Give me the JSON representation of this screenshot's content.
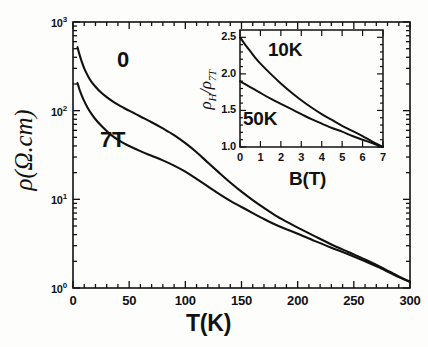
{
  "figure": {
    "background_color": "#fdfdfc",
    "ink_color": "#111111"
  },
  "chart_data": [
    {
      "id": "main",
      "type": "line",
      "title": "",
      "xlabel": "T(K)",
      "ylabel": "ρ(Ω.cm)",
      "xlim": [
        0,
        300
      ],
      "ylim": [
        1,
        1000
      ],
      "yscale": "log",
      "xscale": "linear",
      "grid": false,
      "legend_position": "inline-annotations",
      "xticks": [
        0,
        50,
        100,
        150,
        200,
        250,
        300
      ],
      "xticklabels": [
        "0",
        "50",
        "100",
        "150",
        "200",
        "250",
        "300"
      ],
      "yticks": [
        1,
        10,
        100,
        1000
      ],
      "yticklabels": [
        "10⁰",
        "10¹",
        "10²",
        "10³"
      ],
      "series": [
        {
          "name": "0",
          "label": "0",
          "description": "zero magnetic field resistivity",
          "x": [
            4,
            6,
            8,
            10,
            13,
            16,
            20,
            25,
            30,
            35,
            40,
            45,
            50,
            60,
            70,
            80,
            90,
            100,
            110,
            120,
            130,
            140,
            150,
            160,
            170,
            180,
            190,
            200,
            215,
            230,
            245,
            260,
            275,
            290,
            300
          ],
          "y": [
            520,
            420,
            350,
            300,
            250,
            215,
            186,
            160,
            142,
            128,
            117,
            108,
            100,
            86,
            74,
            63,
            53,
            43,
            34,
            26,
            20,
            15.5,
            12.2,
            9.8,
            8.0,
            6.6,
            5.6,
            4.8,
            3.85,
            3.1,
            2.55,
            2.1,
            1.7,
            1.35,
            1.18
          ]
        },
        {
          "name": "7T",
          "label": "7T",
          "description": "resistivity in 7 Tesla applied field",
          "x": [
            4,
            6,
            8,
            10,
            13,
            16,
            20,
            25,
            30,
            35,
            40,
            45,
            50,
            60,
            70,
            80,
            90,
            100,
            110,
            120,
            130,
            140,
            150,
            160,
            170,
            180,
            190,
            200,
            215,
            230,
            245,
            260,
            275,
            290,
            300
          ],
          "y": [
            205,
            170,
            146,
            128,
            108,
            94,
            80,
            68,
            59,
            52,
            47,
            43,
            40,
            35,
            31,
            27.5,
            24,
            20.5,
            17,
            14,
            11.5,
            9.6,
            8.2,
            7.0,
            6.0,
            5.2,
            4.6,
            4.1,
            3.4,
            2.85,
            2.4,
            2.0,
            1.65,
            1.33,
            1.17
          ]
        }
      ]
    },
    {
      "id": "inset",
      "type": "line",
      "title": "",
      "xlabel": "B(T)",
      "ylabel": "ρ_H/ρ_7T",
      "xlim": [
        0,
        7
      ],
      "ylim": [
        1.0,
        2.6
      ],
      "yscale": "linear",
      "xscale": "linear",
      "grid": false,
      "legend_position": "inline-annotations",
      "xticks": [
        0,
        1,
        2,
        3,
        4,
        5,
        6,
        7
      ],
      "xticklabels": [
        "0",
        "1",
        "2",
        "3",
        "4",
        "5",
        "6",
        "7"
      ],
      "yticks": [
        1.0,
        1.5,
        2.0,
        2.5
      ],
      "yticklabels": [
        "1.0",
        "1.5",
        "2.0",
        "2.5"
      ],
      "series": [
        {
          "name": "10K",
          "label": "10K",
          "description": "normalized Hall/field resistivity ratio at 10 K",
          "x": [
            0,
            0.25,
            0.5,
            0.75,
            1,
            1.5,
            2,
            2.5,
            3,
            3.5,
            4,
            4.5,
            5,
            5.5,
            6,
            6.5,
            7
          ],
          "y": [
            2.5,
            2.4,
            2.31,
            2.22,
            2.14,
            2.0,
            1.87,
            1.75,
            1.64,
            1.54,
            1.45,
            1.37,
            1.29,
            1.22,
            1.15,
            1.07,
            1.0
          ]
        },
        {
          "name": "50K",
          "label": "50K",
          "description": "normalized Hall/field resistivity ratio at 50 K",
          "x": [
            0,
            0.25,
            0.5,
            0.75,
            1,
            1.5,
            2,
            2.5,
            3,
            3.5,
            4,
            4.5,
            5,
            5.5,
            6,
            6.5,
            7
          ],
          "y": [
            1.9,
            1.86,
            1.82,
            1.78,
            1.74,
            1.66,
            1.59,
            1.52,
            1.45,
            1.38,
            1.32,
            1.26,
            1.21,
            1.15,
            1.1,
            1.05,
            1.0
          ]
        }
      ]
    }
  ]
}
